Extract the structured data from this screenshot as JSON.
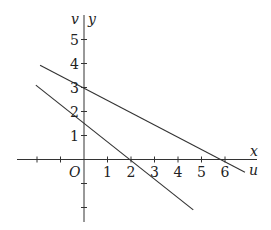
{
  "chart_data": {
    "type": "line",
    "title": "",
    "xlabel": "x",
    "ylabel": "y",
    "secondary_axis_labels": {
      "horizontal": "u",
      "vertical": "v"
    },
    "origin_label": "O",
    "xlim": [
      -3.5,
      7
    ],
    "ylim": [
      -2.6,
      6
    ],
    "x_ticks": [
      -2,
      -1,
      0,
      1,
      2,
      3,
      4,
      5,
      6
    ],
    "x_tick_labels": [
      "1",
      "2",
      "3",
      "4",
      "5",
      "6"
    ],
    "y_ticks": [
      -2,
      -1,
      1,
      2,
      3,
      4,
      5
    ],
    "y_tick_labels": [
      "1",
      "2",
      "3",
      "4",
      "5"
    ],
    "grid": false,
    "series": [
      {
        "name": "upper line",
        "equation": "x + 2y = 6",
        "points": [
          [
            -1.87,
            3.93
          ],
          [
            6.85,
            -0.53
          ]
        ],
        "x_intercept": 6,
        "y_intercept": 3
      },
      {
        "name": "lower line",
        "equation": "3x + 4y = 6",
        "points": [
          [
            -2.05,
            3.1
          ],
          [
            4.65,
            -2.1
          ]
        ],
        "x_intercept": 2,
        "y_intercept": 1.5
      }
    ]
  }
}
